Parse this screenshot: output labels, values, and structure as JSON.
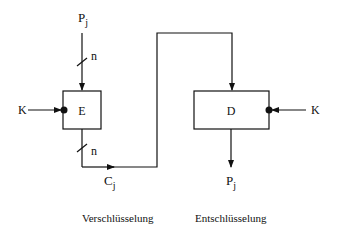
{
  "diagram": {
    "type": "block-diagram",
    "encryption": {
      "input_label": "P",
      "input_sub": "j",
      "input_bus_width": "n",
      "block_label": "E",
      "key_label": "K",
      "output_bus_width": "n",
      "output_label": "C",
      "output_sub": "j",
      "caption": "Verschlüsselung"
    },
    "decryption": {
      "block_label": "D",
      "key_label": "K",
      "output_label": "P",
      "output_sub": "j",
      "caption": "Entschlüsselung"
    },
    "colors": {
      "line": "#111111",
      "background": "#ffffff"
    }
  }
}
